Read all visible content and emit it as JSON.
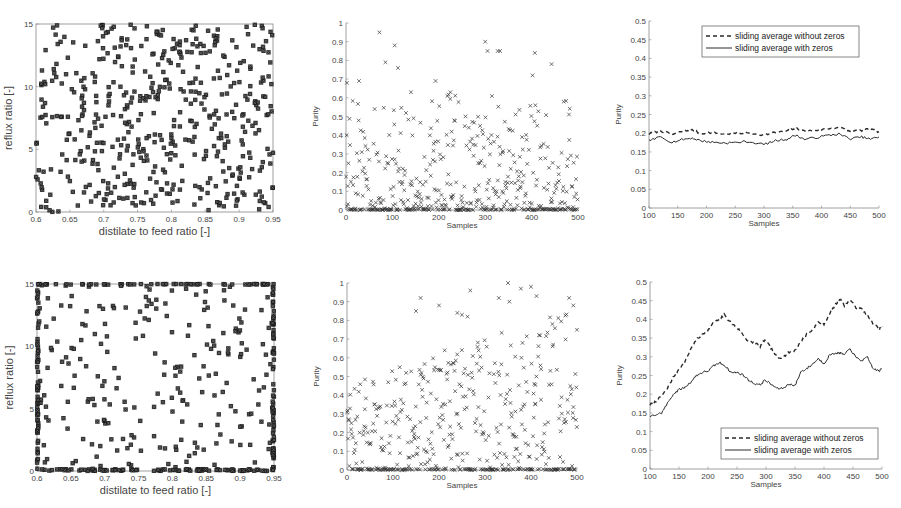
{
  "chart_data": [
    {
      "id": "top-left",
      "type": "scatter",
      "title": "",
      "xlabel": "distilate to feed ratio [-]",
      "ylabel": "reflux ratio [-]",
      "xlim": [
        0.6,
        0.95
      ],
      "ylim": [
        0,
        15
      ],
      "xticks": [
        "0.6",
        "0.65",
        "0.7",
        "0.75",
        "0.8",
        "0.85",
        "0.9",
        "0.95"
      ],
      "yticks": [
        "0",
        "5",
        "10",
        "15"
      ],
      "marker": "filled-x",
      "n_points": 500,
      "distribution": "uniform",
      "seed": 11,
      "box": true
    },
    {
      "id": "top-middle",
      "type": "scatter",
      "xlabel": "Samples",
      "ylabel": "Purity",
      "xlim": [
        0,
        500
      ],
      "ylim": [
        0,
        1
      ],
      "xticks": [
        "0",
        "100",
        "200",
        "300",
        "400",
        "500"
      ],
      "yticks": [
        "0",
        "0.1",
        "0.2",
        "0.3",
        "0.4",
        "0.5",
        "0.6",
        "0.7",
        "0.8",
        "0.9",
        "1"
      ],
      "marker": "x",
      "n_points": 500,
      "distribution": "skewed-low",
      "zero_fraction": 0.15,
      "seed": 23,
      "highlights": [
        [
          2,
          0.68
        ],
        [
          28,
          0.69
        ],
        [
          72,
          0.95
        ],
        [
          85,
          0.79
        ],
        [
          105,
          0.88
        ],
        [
          112,
          0.76
        ],
        [
          140,
          0.63
        ],
        [
          193,
          0.69
        ],
        [
          225,
          0.63
        ],
        [
          300,
          0.9
        ],
        [
          305,
          0.85
        ],
        [
          327,
          0.85
        ],
        [
          332,
          0.85
        ],
        [
          402,
          0.72
        ],
        [
          407,
          0.84
        ],
        [
          443,
          0.78
        ]
      ],
      "box": false
    },
    {
      "id": "top-right",
      "type": "line",
      "xlabel": "Samples",
      "ylabel": "Purity",
      "xlim": [
        100,
        500
      ],
      "ylim": [
        0,
        0.5
      ],
      "xticks": [
        "100",
        "150",
        "200",
        "250",
        "300",
        "350",
        "400",
        "450",
        "500"
      ],
      "yticks": [
        "0",
        "0.05",
        "0.1",
        "0.15",
        "0.2",
        "0.25",
        "0.3",
        "0.35",
        "0.4",
        "0.45",
        "0.5"
      ],
      "legend": {
        "position": "top-right",
        "entries": [
          "sliding average without zeros",
          "sliding average with zeros"
        ]
      },
      "x": [
        100,
        120,
        140,
        160,
        175,
        190,
        210,
        230,
        250,
        270,
        300,
        320,
        340,
        355,
        370,
        390,
        410,
        430,
        450,
        470,
        485,
        500
      ],
      "series": [
        {
          "name": "sliding average without zeros",
          "style": "dashed",
          "values": [
            0.198,
            0.207,
            0.196,
            0.206,
            0.208,
            0.2,
            0.202,
            0.198,
            0.2,
            0.201,
            0.196,
            0.202,
            0.205,
            0.214,
            0.205,
            0.208,
            0.212,
            0.216,
            0.204,
            0.208,
            0.21,
            0.204
          ]
        },
        {
          "name": "sliding average with zeros",
          "style": "solid",
          "values": [
            0.18,
            0.19,
            0.176,
            0.184,
            0.187,
            0.18,
            0.176,
            0.174,
            0.175,
            0.178,
            0.17,
            0.18,
            0.184,
            0.195,
            0.184,
            0.188,
            0.194,
            0.198,
            0.185,
            0.19,
            0.184,
            0.19
          ]
        }
      ],
      "box": false
    },
    {
      "id": "bottom-left",
      "type": "scatter",
      "xlabel": "distilate to feed ratio [-]",
      "ylabel": "reflux ratio [-]",
      "xlim": [
        0.6,
        0.95
      ],
      "ylim": [
        0,
        15
      ],
      "xticks": [
        "0.6",
        "0.65",
        "0.7",
        "0.75",
        "0.8",
        "0.85",
        "0.9",
        "0.95"
      ],
      "yticks": [
        "0",
        "5",
        "10",
        "15"
      ],
      "marker": "filled-x",
      "n_points": 500,
      "distribution": "boundary-clustered",
      "seed": 37,
      "box": true
    },
    {
      "id": "bottom-middle",
      "type": "scatter",
      "xlabel": "Samples",
      "ylabel": "Purity",
      "xlim": [
        0,
        500
      ],
      "ylim": [
        0,
        1
      ],
      "xticks": [
        "0",
        "100",
        "200",
        "300",
        "400",
        "500"
      ],
      "yticks": [
        "0",
        "0.1",
        "0.2",
        "0.3",
        "0.4",
        "0.5",
        "0.6",
        "0.7",
        "0.8",
        "0.9",
        "1"
      ],
      "marker": "x",
      "n_points": 500,
      "distribution": "increasing-spread",
      "zero_fraction": 0.3,
      "seed": 51,
      "highlights": [
        [
          160,
          0.92
        ],
        [
          150,
          0.85
        ],
        [
          200,
          0.88
        ],
        [
          268,
          0.96
        ],
        [
          240,
          0.84
        ],
        [
          250,
          0.83
        ],
        [
          262,
          0.82
        ],
        [
          330,
          0.92
        ],
        [
          350,
          1.0
        ],
        [
          353,
          0.9
        ],
        [
          378,
          0.97
        ],
        [
          400,
          0.98
        ],
        [
          412,
          0.93
        ],
        [
          483,
          0.92
        ],
        [
          492,
          0.88
        ],
        [
          500,
          0.75
        ]
      ],
      "box": false
    },
    {
      "id": "bottom-right",
      "type": "line",
      "xlabel": "Samples",
      "ylabel": "Purity",
      "xlim": [
        100,
        500
      ],
      "ylim": [
        0,
        0.5
      ],
      "xticks": [
        "100",
        "150",
        "200",
        "250",
        "300",
        "350",
        "400",
        "450",
        "500"
      ],
      "yticks": [
        "0",
        "0.05",
        "0.1",
        "0.15",
        "0.2",
        "0.25",
        "0.3",
        "0.35",
        "0.4",
        "0.45",
        "0.5"
      ],
      "legend": {
        "position": "bottom-right",
        "entries": [
          "sliding average without zeros",
          "sliding average with zeros"
        ]
      },
      "x": [
        100,
        110,
        120,
        130,
        140,
        150,
        160,
        170,
        180,
        190,
        200,
        210,
        220,
        228,
        240,
        250,
        260,
        270,
        280,
        290,
        298,
        310,
        320,
        330,
        340,
        350,
        360,
        370,
        380,
        390,
        400,
        410,
        420,
        428,
        435,
        445,
        455,
        465,
        475,
        485,
        495,
        500
      ],
      "series": [
        {
          "name": "sliding average without zeros",
          "style": "dashed",
          "values": [
            0.172,
            0.18,
            0.195,
            0.215,
            0.245,
            0.268,
            0.285,
            0.32,
            0.345,
            0.36,
            0.37,
            0.392,
            0.4,
            0.412,
            0.39,
            0.378,
            0.36,
            0.34,
            0.338,
            0.328,
            0.346,
            0.32,
            0.296,
            0.3,
            0.312,
            0.318,
            0.34,
            0.36,
            0.372,
            0.392,
            0.388,
            0.415,
            0.44,
            0.456,
            0.438,
            0.453,
            0.432,
            0.428,
            0.41,
            0.388,
            0.375,
            0.38
          ]
        },
        {
          "name": "sliding average with zeros",
          "style": "solid",
          "values": [
            0.14,
            0.145,
            0.15,
            0.175,
            0.2,
            0.212,
            0.218,
            0.232,
            0.25,
            0.258,
            0.262,
            0.276,
            0.284,
            0.278,
            0.258,
            0.258,
            0.252,
            0.238,
            0.228,
            0.225,
            0.238,
            0.225,
            0.215,
            0.216,
            0.228,
            0.222,
            0.26,
            0.268,
            0.28,
            0.295,
            0.282,
            0.305,
            0.31,
            0.31,
            0.305,
            0.322,
            0.298,
            0.29,
            0.298,
            0.268,
            0.262,
            0.268
          ]
        }
      ],
      "box": false
    }
  ],
  "labels": {
    "tl_x": "distilate to feed ratio [-]",
    "tl_y": "reflux ratio [-]",
    "bl_x": "distilate to feed ratio [-]",
    "bl_y": "reflux ratio [-]",
    "samples": "Samples",
    "purity": "Purity",
    "legend_dashed": "sliding average without zeros",
    "legend_solid": "sliding average with zeros"
  },
  "colors": {
    "marker": "#1a1a1a",
    "axis": "#888888",
    "line": "#2a2a2a",
    "text": "#444444"
  }
}
